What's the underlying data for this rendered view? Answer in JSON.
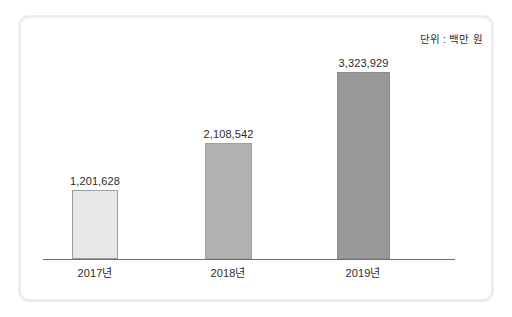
{
  "figure": {
    "unit_caption": "단위 : 백만 원",
    "frame_color": "#ededed",
    "axis_color": "#6e6e6e",
    "background": "#ffffff"
  },
  "chart_data": {
    "type": "bar",
    "title": "",
    "subtitle": "",
    "xlabel": "",
    "ylabel": "",
    "unit": "단위 : 백만 원",
    "grid": false,
    "legend": false,
    "legend_position": "none",
    "ylim": [
      0,
      3700000
    ],
    "categories": [
      "2017년",
      "2018년",
      "2019년"
    ],
    "values": [
      1201628,
      2108542,
      3323929
    ],
    "value_labels": [
      "1,201,628",
      "2,108,542",
      "3,323,929"
    ],
    "bar_colors": [
      "#e8e8e8",
      "#b2b2b2",
      "#989898"
    ],
    "bar_border_colors": [
      "#9e9e9e",
      "#a0a0a0",
      "#8a8a8a"
    ],
    "series": [
      {
        "name": "매출액",
        "values": [
          1201628,
          2108542,
          3323929
        ]
      }
    ],
    "bars": [
      {
        "category": "2017년",
        "value": 1201628,
        "label": "1,201,628",
        "fill": "#e8e8e8",
        "stroke": "#9e9e9e",
        "left_px": 72,
        "width_px": 46,
        "height_px": 69,
        "center_px": 95
      },
      {
        "category": "2018년",
        "value": 2108542,
        "label": "2,108,542",
        "fill": "#b2b2b2",
        "stroke": "#a0a0a0",
        "left_px": 205,
        "width_px": 47,
        "height_px": 116,
        "center_px": 228
      },
      {
        "category": "2019년",
        "value": 3323929,
        "label": "3,323,929",
        "fill": "#989898",
        "stroke": "#8a8a8a",
        "left_px": 337,
        "width_px": 53,
        "height_px": 187,
        "center_px": 363
      }
    ]
  }
}
